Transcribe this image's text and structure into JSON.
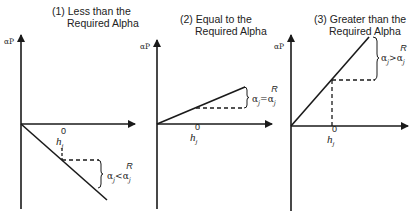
{
  "figure": {
    "panels": [
      {
        "id": "less",
        "title_line1": "(1) Less than the",
        "title_line2": "Required Alpha",
        "y_axis_label": "αP",
        "x_marker_label": "h",
        "x_marker_sub": "j",
        "x_marker_sup": "0",
        "comparison_lhs": "α",
        "comparison_lhs_sub": "j",
        "comparison_op": "<",
        "comparison_rhs": "α",
        "comparison_rhs_sub": "j",
        "comparison_rhs_sup": "R",
        "slope": "negative"
      },
      {
        "id": "equal",
        "title_line1": "(2) Equal to the",
        "title_line2": "Required Alpha",
        "y_axis_label": "αP",
        "x_marker_label": "h",
        "x_marker_sub": "j",
        "x_marker_sup": "0",
        "comparison_lhs": "α",
        "comparison_lhs_sub": "j",
        "comparison_op": "=",
        "comparison_rhs": "α",
        "comparison_rhs_sub": "j",
        "comparison_rhs_sup": "R",
        "slope": "shallow-positive"
      },
      {
        "id": "greater",
        "title_line1": "(3) Greater than the",
        "title_line2": "Required Alpha",
        "y_axis_label": "αP",
        "x_marker_label": "h",
        "x_marker_sub": "j",
        "x_marker_sup": "0",
        "comparison_lhs": "α",
        "comparison_lhs_sub": "j",
        "comparison_op": ">",
        "comparison_rhs": "α",
        "comparison_rhs_sub": "j",
        "comparison_rhs_sup": "R",
        "slope": "steep-positive"
      }
    ],
    "colors": {
      "ink": "#1a1a1a",
      "background": "#ffffff"
    }
  }
}
